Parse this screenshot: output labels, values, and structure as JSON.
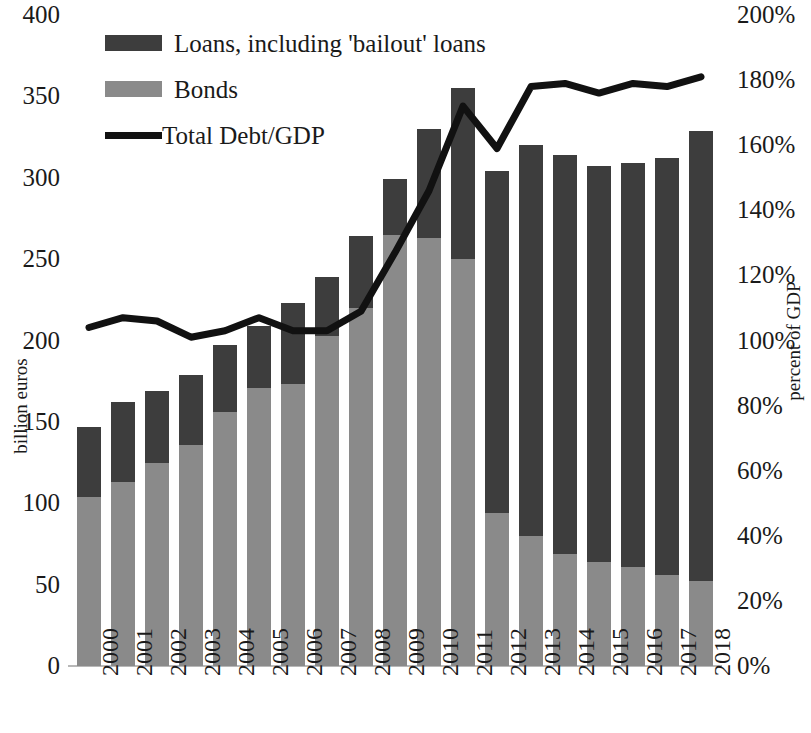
{
  "chart_data": {
    "type": "bar",
    "title": "",
    "subtitle": "",
    "xlabel": "",
    "ylabel": "billion euros",
    "y2label": "percent of GDP",
    "grid": false,
    "legend_position": "top-left",
    "stacked": true,
    "categories": [
      "2000",
      "2001",
      "2002",
      "2003",
      "2004",
      "2005",
      "2006",
      "2007",
      "2008",
      "2009",
      "2010",
      "2011",
      "2012",
      "2013",
      "2014",
      "2015",
      "2016",
      "2017",
      "2018"
    ],
    "ylim": [
      0,
      400
    ],
    "yticks": [
      "0",
      "50",
      "100",
      "150",
      "200",
      "250",
      "300",
      "350",
      "400"
    ],
    "ytick_values": [
      0,
      50,
      100,
      150,
      200,
      250,
      300,
      350,
      400
    ],
    "y2lim": [
      0,
      200
    ],
    "y2ticks": [
      "0%",
      "20%",
      "40%",
      "60%",
      "80%",
      "100%",
      "120%",
      "140%",
      "160%",
      "180%",
      "200%"
    ],
    "y2tick_values": [
      0,
      20,
      40,
      60,
      80,
      100,
      120,
      140,
      160,
      180,
      200
    ],
    "series": [
      {
        "name": "Bonds",
        "axis": "left",
        "kind": "bar",
        "color": "#8a8a8a",
        "values": [
          104,
          113,
          125,
          136,
          156,
          171,
          173,
          203,
          220,
          265,
          263,
          250,
          94,
          80,
          69,
          64,
          61,
          56,
          52
        ]
      },
      {
        "name": "Loans, including 'bailout' loans",
        "axis": "left",
        "kind": "bar",
        "color": "#3d3d3d",
        "values": [
          43,
          49,
          44,
          43,
          41,
          38,
          50,
          36,
          44,
          34,
          67,
          105,
          210,
          240,
          245,
          243,
          248,
          256,
          277
        ]
      },
      {
        "name": "Total Debt/GDP",
        "axis": "right",
        "kind": "line",
        "color": "#111111",
        "values": [
          104,
          107,
          106,
          101,
          103,
          107,
          103,
          103,
          109,
          127,
          146,
          172,
          159,
          178,
          179,
          176,
          179,
          178,
          181
        ]
      }
    ],
    "totals": [
      147,
      162,
      169,
      179,
      197,
      209,
      223,
      239,
      264,
      299,
      330,
      355,
      304,
      320,
      314,
      307,
      309,
      312,
      329
    ],
    "legend": [
      {
        "label": "Loans, including 'bailout' loans",
        "swatch": "loans"
      },
      {
        "label": "Bonds",
        "swatch": "bonds"
      },
      {
        "label": "Total Debt/GDP",
        "swatch": "line"
      }
    ],
    "colors": {
      "loans": "#3d3d3d",
      "bonds": "#8a8a8a",
      "line": "#111111",
      "axis": "#b8b8b8",
      "text": "#1a1a1a",
      "background": "#ffffff"
    }
  }
}
